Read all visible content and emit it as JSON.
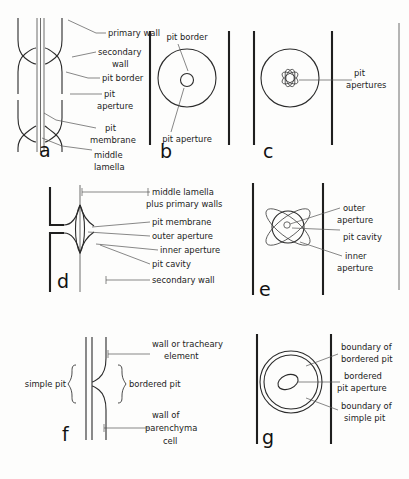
{
  "figure": {
    "background_color": "#fdfdfc",
    "ink_color": "#1f1f1f"
  },
  "panels": [
    {
      "id": "a",
      "letter": "a",
      "view": "sectional view of bordered pit pair",
      "labels": [
        {
          "key": "primary_wall",
          "text": "primary wall"
        },
        {
          "key": "secondary_wall_1",
          "text": "secondary"
        },
        {
          "key": "secondary_wall_2",
          "text": "wall"
        },
        {
          "key": "pit_border",
          "text": "pit border"
        },
        {
          "key": "pit_aperture_1",
          "text": "pit"
        },
        {
          "key": "pit_aperture_2",
          "text": "aperture"
        },
        {
          "key": "pit_membrane_1",
          "text": "pit"
        },
        {
          "key": "pit_membrane_2",
          "text": "membrane"
        },
        {
          "key": "middle_lamella_1",
          "text": "middle"
        },
        {
          "key": "middle_lamella_2",
          "text": "lamella"
        }
      ]
    },
    {
      "id": "b",
      "letter": "b",
      "view": "face view of bordered pit",
      "labels": [
        {
          "key": "pit_border",
          "text": "pit border"
        },
        {
          "key": "pit_aperture",
          "text": "pit aperture"
        }
      ]
    },
    {
      "id": "c",
      "letter": "c",
      "view": "face view of bordered pit with multiple apertures",
      "labels": [
        {
          "key": "pit_apertures_1",
          "text": "pit"
        },
        {
          "key": "pit_apertures_2",
          "text": "apertures"
        }
      ]
    },
    {
      "id": "d",
      "letter": "d",
      "view": "sectional view of single bordered pit",
      "labels": [
        {
          "key": "middle_lamella_1",
          "text": "middle lamella"
        },
        {
          "key": "middle_lamella_2",
          "text": "plus primary walls"
        },
        {
          "key": "pit_membrane",
          "text": "pit membrane"
        },
        {
          "key": "outer_aperture",
          "text": "outer aperture"
        },
        {
          "key": "inner_aperture",
          "text": "inner aperture"
        },
        {
          "key": "pit_cavity",
          "text": "pit cavity"
        },
        {
          "key": "secondary_wall",
          "text": "secondary wall"
        }
      ]
    },
    {
      "id": "e",
      "letter": "e",
      "view": "face view showing crossed apertures",
      "labels": [
        {
          "key": "outer_aperture_1",
          "text": "outer"
        },
        {
          "key": "outer_aperture_2",
          "text": "aperture"
        },
        {
          "key": "pit_cavity",
          "text": "pit cavity"
        },
        {
          "key": "inner_aperture_1",
          "text": "inner"
        },
        {
          "key": "inner_aperture_2",
          "text": "aperture"
        }
      ]
    },
    {
      "id": "f",
      "letter": "f",
      "view": "sectional view of half-bordered pit pair",
      "labels": [
        {
          "key": "wall_tracheary_1",
          "text": "wall or tracheary"
        },
        {
          "key": "wall_tracheary_2",
          "text": "element"
        },
        {
          "key": "simple_pit",
          "text": "simple pit"
        },
        {
          "key": "bordered_pit",
          "text": "bordered pit"
        },
        {
          "key": "wall_parenchyma_1",
          "text": "wall of"
        },
        {
          "key": "wall_parenchyma_2",
          "text": "parenchyma"
        },
        {
          "key": "wall_parenchyma_3",
          "text": "cell"
        }
      ]
    },
    {
      "id": "g",
      "letter": "g",
      "view": "face view of half-bordered pit pair",
      "labels": [
        {
          "key": "boundary_bordered_1",
          "text": "boundary of"
        },
        {
          "key": "boundary_bordered_2",
          "text": "bordered pit"
        },
        {
          "key": "bordered_aperture_1",
          "text": "bordered"
        },
        {
          "key": "bordered_aperture_2",
          "text": "pit aperture"
        },
        {
          "key": "boundary_simple_1",
          "text": "boundary of"
        },
        {
          "key": "boundary_simple_2",
          "text": "simple pit"
        }
      ]
    }
  ]
}
